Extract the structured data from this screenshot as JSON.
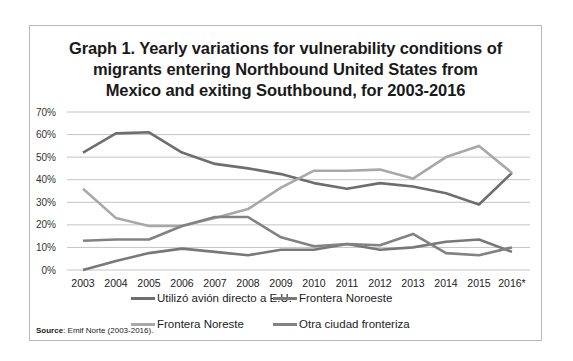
{
  "title_lines": [
    "Graph 1. Yearly variations for vulnerability conditions of",
    "migrants entering Northbound United States from",
    "Mexico and exiting Southbound, for 2003-2016"
  ],
  "source": {
    "label": "Source",
    "text": ": Emif Norte (2003-2016)."
  },
  "chart_data": {
    "type": "line",
    "title": "Graph 1. Yearly variations for vulnerability conditions of migrants entering Northbound United States from Mexico and exiting Southbound, for 2003-2016",
    "xlabel": "",
    "ylabel": "",
    "categories": [
      "2003",
      "2004",
      "2005",
      "2006",
      "2007",
      "2008",
      "2009",
      "2010",
      "2011",
      "2012",
      "2013",
      "2014",
      "2015",
      "2016*"
    ],
    "yticks": [
      "0%",
      "10%",
      "20%",
      "30%",
      "40%",
      "50%",
      "60%",
      "70%"
    ],
    "ylim": [
      0,
      70
    ],
    "grid": true,
    "legend_position": "bottom",
    "series": [
      {
        "name": "Utilizó avión directo a E.U.",
        "color": "#6e6e6e",
        "values": [
          52,
          60.5,
          61,
          52,
          47,
          45,
          42.5,
          38.5,
          36,
          38.5,
          37,
          34,
          29,
          43
        ]
      },
      {
        "name": "Frontera Noroeste",
        "color": "#787878",
        "values": [
          0,
          4,
          7.5,
          9.5,
          8,
          6.5,
          9,
          9,
          11.5,
          9,
          10,
          12.5,
          13.5,
          8
        ]
      },
      {
        "name": "Frontera Noreste",
        "color": "#a8a8a8",
        "values": [
          36,
          23,
          19.5,
          19.5,
          23,
          27,
          36.5,
          44,
          44,
          44.5,
          40.5,
          50,
          55,
          43
        ]
      },
      {
        "name": "Otra ciudad fronteriza",
        "color": "#828282",
        "values": [
          13,
          13.5,
          13.5,
          19.5,
          23.5,
          23.5,
          14.5,
          10.5,
          11.5,
          11,
          16,
          7.5,
          6.5,
          10
        ]
      }
    ]
  },
  "legend": [
    {
      "label": "Utilizó avión directo a E.U.",
      "color": "#6e6e6e"
    },
    {
      "label": "Frontera Noroeste",
      "color": "#787878"
    },
    {
      "label": "Frontera Noreste",
      "color": "#a8a8a8"
    },
    {
      "label": "Otra ciudad fronteriza",
      "color": "#828282"
    }
  ]
}
